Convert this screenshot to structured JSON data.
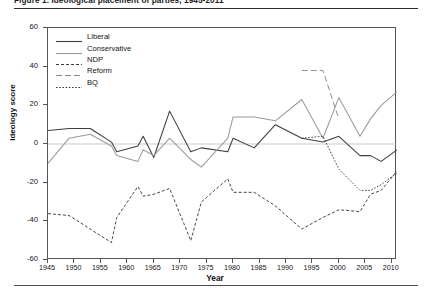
{
  "figure": {
    "title": "Figure 1. Ideological placement of parties, 1945-2011",
    "title_visible_fragment": "Figure 1. Ideological placement of parties, 1945-2011"
  },
  "chart_data": {
    "type": "line",
    "title": "Figure 1. Ideological placement of parties, 1945-2011",
    "xlabel": "Year",
    "ylabel": "Ideology score",
    "xlim": [
      1945,
      2011
    ],
    "ylim": [
      -60,
      60
    ],
    "ytick_labels": [
      "60",
      "40",
      "20",
      "0",
      "-20",
      "-40",
      "-60"
    ],
    "ytick_values": [
      60,
      40,
      20,
      0,
      -20,
      -40,
      -60
    ],
    "xtick_labels": [
      "1945",
      "1950",
      "1955",
      "1960",
      "1965",
      "1970",
      "1975",
      "1980",
      "1985",
      "1990",
      "1995",
      "2000",
      "2005",
      "2010"
    ],
    "xtick_values": [
      1945,
      1950,
      1955,
      1960,
      1965,
      1970,
      1975,
      1980,
      1985,
      1990,
      1995,
      2000,
      2005,
      2010
    ],
    "grid": false,
    "zero_line": true,
    "legend_position": "upper-left-inside",
    "series": [
      {
        "name": "Liberal",
        "color": "#3d3d3d",
        "dash": "none",
        "x": [
          1945,
          1949,
          1953,
          1957,
          1958,
          1962,
          1963,
          1965,
          1968,
          1972,
          1974,
          1979,
          1980,
          1984,
          1988,
          1993,
          1997,
          2000,
          2004,
          2006,
          2008,
          2011
        ],
        "y": [
          7,
          8,
          8,
          1,
          -4,
          -1,
          4,
          -7,
          17,
          -4,
          -2,
          -4,
          3,
          -2,
          10,
          3,
          1,
          4,
          -6,
          -6,
          -9,
          -3
        ]
      },
      {
        "name": "Conservative",
        "color": "#9a9a9a",
        "dash": "none",
        "x": [
          1945,
          1949,
          1953,
          1957,
          1958,
          1962,
          1963,
          1965,
          1968,
          1972,
          1974,
          1979,
          1980,
          1984,
          1988,
          1993,
          1997,
          2000,
          2004,
          2006,
          2008,
          2011
        ],
        "y": [
          -10,
          3,
          5,
          -1,
          -6,
          -9,
          -3,
          -6,
          3,
          -8,
          -12,
          3,
          14,
          14,
          12,
          23,
          3,
          24,
          4,
          13,
          20,
          27
        ]
      },
      {
        "name": "NDP",
        "color": "#3d3d3d",
        "dash": "dashed-fine",
        "x": [
          1945,
          1949,
          1953,
          1957,
          1958,
          1962,
          1963,
          1965,
          1968,
          1972,
          1974,
          1979,
          1980,
          1984,
          1988,
          1993,
          1997,
          2000,
          2004,
          2006,
          2008,
          2011
        ],
        "y": [
          -36,
          -37,
          -44,
          -51,
          -38,
          -22,
          -27,
          -26,
          -23,
          -50,
          -30,
          -18,
          -25,
          -25,
          -32,
          -44,
          -38,
          -34,
          -35,
          -26,
          -24,
          -14
        ]
      },
      {
        "name": "Reform",
        "color": "#8a8a8a",
        "dash": "dashed-long",
        "x": [
          1993,
          1997,
          2000
        ],
        "y": [
          38,
          38,
          13
        ]
      },
      {
        "name": "BQ",
        "color": "#3d3d3d",
        "dash": "dotted",
        "x": [
          1993,
          1997,
          2000,
          2004,
          2006,
          2008,
          2011
        ],
        "y": [
          3,
          4,
          -13,
          -24,
          -24,
          -21,
          -15
        ]
      }
    ]
  },
  "legend": {
    "items": [
      {
        "label": "Liberal",
        "style": "solid-dark"
      },
      {
        "label": "Conservative",
        "style": "solid-gray"
      },
      {
        "label": "NDP",
        "style": "dashed-fine"
      },
      {
        "label": "Reform",
        "style": "dashed-long"
      },
      {
        "label": "BQ",
        "style": "dotted"
      }
    ]
  },
  "colors": {
    "liberal": "#3d3d3d",
    "conservative": "#9a9a9a",
    "ndp": "#3d3d3d",
    "reform": "#8a8a8a",
    "bq": "#3d3d3d",
    "axis": "#555555",
    "zero_line": "#c9c9c9"
  }
}
